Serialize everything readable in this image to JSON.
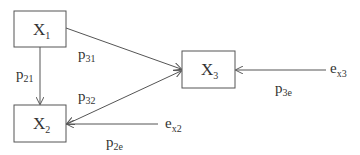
{
  "diagram": {
    "type": "path-diagram",
    "nodes": [
      {
        "id": "X1",
        "base": "X",
        "sub": "1"
      },
      {
        "id": "X2",
        "base": "X",
        "sub": "2"
      },
      {
        "id": "X3",
        "base": "X",
        "sub": "3"
      }
    ],
    "errors": [
      {
        "id": "ex2",
        "base": "e",
        "sub": "x2"
      },
      {
        "id": "ex3",
        "base": "e",
        "sub": "x3"
      }
    ],
    "edges": [
      {
        "from": "X1",
        "to": "X3",
        "label_base": "p",
        "label_sub": "31"
      },
      {
        "from": "X1",
        "to": "X2",
        "label_base": "p",
        "label_sub": "21"
      },
      {
        "from": "X2",
        "to": "X3",
        "label_base": "p",
        "label_sub": "32",
        "bidirectional_heads": true
      },
      {
        "from": "ex2",
        "to": "X2",
        "label_base": "p",
        "label_sub": "2e"
      },
      {
        "from": "ex3",
        "to": "X3",
        "label_base": "p",
        "label_sub": "3e"
      }
    ],
    "colors": {
      "stroke": "#555555",
      "text": "#333333",
      "background": "#ffffff"
    }
  }
}
